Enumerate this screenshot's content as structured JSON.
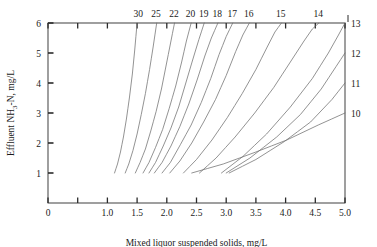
{
  "chart_data": {
    "type": "line",
    "title": "",
    "xlabel": "Mixed liquor suspended solids, mg/L",
    "ylabel": "Effluent NH3-N, mg/L",
    "xlim": [
      0,
      5.0
    ],
    "ylim": [
      0,
      6
    ],
    "grid": false,
    "legend_position": "curve-labels-top-and-right",
    "x_ticks": [
      "0",
      "1.0",
      "1.5",
      "2.0",
      "2.5",
      "3.0",
      "3.5",
      "4.0",
      "4.5",
      "5.0"
    ],
    "x_tick_values": [
      0,
      1.0,
      1.5,
      2.0,
      2.5,
      3.0,
      3.5,
      4.0,
      4.5,
      5.0
    ],
    "y_ticks": [
      "1",
      "2",
      "3",
      "4",
      "5",
      "6"
    ],
    "y_tick_values": [
      1,
      2,
      3,
      4,
      5,
      6
    ],
    "top_labels": [
      "30",
      "25",
      "22",
      "20",
      "19",
      "18",
      "17",
      "16",
      "15",
      "14"
    ],
    "right_labels": [
      "13",
      "12",
      "11",
      "10"
    ],
    "series": [
      {
        "name": "30",
        "label_position": "top",
        "label_x": 1.52,
        "points": [
          [
            1.12,
            1.0
          ],
          [
            1.17,
            1.3
          ],
          [
            1.22,
            1.7
          ],
          [
            1.27,
            2.2
          ],
          [
            1.32,
            2.8
          ],
          [
            1.37,
            3.5
          ],
          [
            1.42,
            4.3
          ],
          [
            1.46,
            5.1
          ],
          [
            1.5,
            6.0
          ]
        ]
      },
      {
        "name": "25",
        "label_position": "top",
        "label_x": 1.82,
        "points": [
          [
            1.3,
            1.0
          ],
          [
            1.36,
            1.3
          ],
          [
            1.43,
            1.75
          ],
          [
            1.5,
            2.3
          ],
          [
            1.57,
            2.95
          ],
          [
            1.64,
            3.65
          ],
          [
            1.71,
            4.45
          ],
          [
            1.77,
            5.2
          ],
          [
            1.83,
            6.0
          ]
        ]
      },
      {
        "name": "22",
        "label_position": "top",
        "label_x": 2.12,
        "points": [
          [
            1.47,
            1.0
          ],
          [
            1.55,
            1.35
          ],
          [
            1.64,
            1.8
          ],
          [
            1.73,
            2.4
          ],
          [
            1.82,
            3.05
          ],
          [
            1.91,
            3.8
          ],
          [
            1.99,
            4.6
          ],
          [
            2.06,
            5.3
          ],
          [
            2.13,
            6.0
          ]
        ]
      },
      {
        "name": "20",
        "label_position": "top",
        "label_x": 2.4,
        "points": [
          [
            1.6,
            1.0
          ],
          [
            1.7,
            1.35
          ],
          [
            1.81,
            1.85
          ],
          [
            1.93,
            2.45
          ],
          [
            2.04,
            3.15
          ],
          [
            2.15,
            3.9
          ],
          [
            2.25,
            4.7
          ],
          [
            2.33,
            5.4
          ],
          [
            2.41,
            6.0
          ]
        ]
      },
      {
        "name": "19",
        "label_position": "top",
        "label_x": 2.62,
        "points": [
          [
            1.7,
            1.0
          ],
          [
            1.81,
            1.35
          ],
          [
            1.94,
            1.9
          ],
          [
            2.07,
            2.5
          ],
          [
            2.2,
            3.2
          ],
          [
            2.32,
            4.0
          ],
          [
            2.44,
            4.8
          ],
          [
            2.54,
            5.45
          ],
          [
            2.63,
            6.0
          ]
        ]
      },
      {
        "name": "18",
        "label_position": "top",
        "label_x": 2.85,
        "points": [
          [
            1.79,
            1.0
          ],
          [
            1.92,
            1.35
          ],
          [
            2.07,
            1.9
          ],
          [
            2.22,
            2.55
          ],
          [
            2.37,
            3.3
          ],
          [
            2.51,
            4.1
          ],
          [
            2.64,
            4.9
          ],
          [
            2.75,
            5.5
          ],
          [
            2.86,
            6.0
          ]
        ]
      },
      {
        "name": "17",
        "label_position": "top",
        "label_x": 3.1,
        "points": [
          [
            1.92,
            1.0
          ],
          [
            2.06,
            1.35
          ],
          [
            2.23,
            1.95
          ],
          [
            2.41,
            2.6
          ],
          [
            2.58,
            3.35
          ],
          [
            2.74,
            4.15
          ],
          [
            2.88,
            4.95
          ],
          [
            3.0,
            5.55
          ],
          [
            3.11,
            6.0
          ]
        ]
      },
      {
        "name": "16",
        "label_position": "top",
        "label_x": 3.38,
        "points": [
          [
            2.05,
            1.0
          ],
          [
            2.22,
            1.4
          ],
          [
            2.42,
            2.0
          ],
          [
            2.62,
            2.7
          ],
          [
            2.82,
            3.45
          ],
          [
            3.0,
            4.25
          ],
          [
            3.16,
            5.05
          ],
          [
            3.28,
            5.6
          ],
          [
            3.39,
            6.0
          ]
        ]
      },
      {
        "name": "15",
        "label_position": "top",
        "label_x": 3.92,
        "points": [
          [
            2.28,
            1.0
          ],
          [
            2.5,
            1.45
          ],
          [
            2.76,
            2.1
          ],
          [
            3.02,
            2.85
          ],
          [
            3.27,
            3.65
          ],
          [
            3.5,
            4.45
          ],
          [
            3.69,
            5.2
          ],
          [
            3.82,
            5.7
          ],
          [
            3.93,
            6.0
          ]
        ]
      },
      {
        "name": "14",
        "label_position": "top",
        "label_x": 4.55,
        "points": [
          [
            2.55,
            1.0
          ],
          [
            2.83,
            1.5
          ],
          [
            3.15,
            2.2
          ],
          [
            3.48,
            3.0
          ],
          [
            3.8,
            3.85
          ],
          [
            4.08,
            4.7
          ],
          [
            4.31,
            5.4
          ],
          [
            4.45,
            5.8
          ],
          [
            4.56,
            6.0
          ]
        ]
      },
      {
        "name": "13",
        "label_position": "right",
        "label_y": 6.0,
        "points": [
          [
            2.92,
            1.0
          ],
          [
            3.28,
            1.55
          ],
          [
            3.68,
            2.3
          ],
          [
            4.08,
            3.2
          ],
          [
            4.45,
            4.15
          ],
          [
            4.72,
            5.0
          ],
          [
            4.89,
            5.6
          ],
          [
            5.0,
            6.0
          ]
        ]
      },
      {
        "name": "12",
        "label_position": "right",
        "label_y": 5.0,
        "points": [
          [
            3.0,
            1.0
          ],
          [
            3.4,
            1.5
          ],
          [
            3.85,
            2.2
          ],
          [
            4.25,
            2.95
          ],
          [
            4.6,
            3.8
          ],
          [
            4.85,
            4.55
          ],
          [
            5.0,
            5.0
          ]
        ]
      },
      {
        "name": "11",
        "label_position": "right",
        "label_y": 4.0,
        "points": [
          [
            3.05,
            1.0
          ],
          [
            3.5,
            1.45
          ],
          [
            3.98,
            2.05
          ],
          [
            4.42,
            2.7
          ],
          [
            4.78,
            3.45
          ],
          [
            5.0,
            4.0
          ]
        ]
      },
      {
        "name": "10",
        "label_position": "right",
        "label_y": 3.0,
        "points": [
          [
            2.42,
            1.0
          ],
          [
            2.95,
            1.3
          ],
          [
            3.5,
            1.7
          ],
          [
            4.02,
            2.1
          ],
          [
            4.55,
            2.6
          ],
          [
            5.0,
            3.0
          ]
        ]
      }
    ]
  },
  "axes": {
    "y_axis_title": "Effluent NH3-N, mg/L",
    "y_axis_title_parts": {
      "pre": "Effluent NH",
      "sub": "3",
      "post": "-N, mg/L"
    },
    "x_axis_title": "Mixed liquor suspended solids, mg/L"
  },
  "style": {
    "curve_color": "#6f6f6f",
    "axis_color": "#2b2b2b",
    "text_color": "#1a1a1a",
    "background": "#ffffff"
  }
}
